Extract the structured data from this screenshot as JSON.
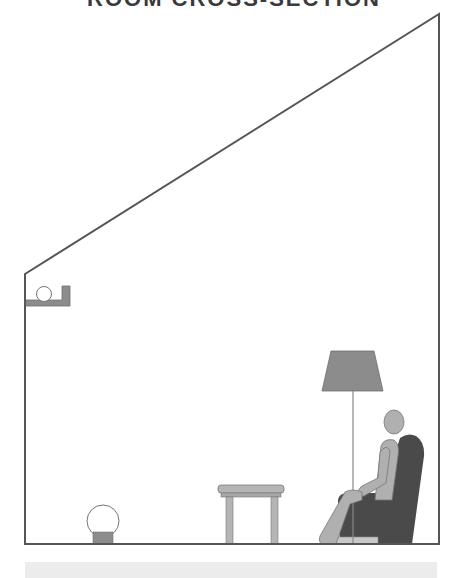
{
  "title": "ROOM CROSS-SECTION",
  "diagram": {
    "type": "room-cross-section",
    "room": {
      "outline_points": [
        [
          25,
          274
        ],
        [
          439,
          14
        ],
        [
          439,
          544
        ],
        [
          25,
          544
        ]
      ],
      "stroke_color": "#555555"
    },
    "elements": [
      {
        "name": "wall-shelf-lamp",
        "description": "globe lamp on wall-mounted bracket shelf"
      },
      {
        "name": "floor-globe-lamp",
        "description": "globe lamp on floor with base"
      },
      {
        "name": "side-table",
        "description": "small side table"
      },
      {
        "name": "floor-lamp",
        "description": "standing floor lamp with trapezoid shade"
      },
      {
        "name": "seated-person",
        "description": "person sitting in armchair"
      },
      {
        "name": "armchair",
        "description": "high-back armchair"
      },
      {
        "name": "footrest",
        "description": "low footrest"
      }
    ],
    "colors": {
      "outline": "#555555",
      "fixture_gray": "#8c8c8c",
      "light_gray": "#b5b5b5",
      "chair_dark": "#4a4a4a",
      "person": "#b0b0b0",
      "bulb_fill": "#ffffff",
      "caption_bar": "#ececec"
    }
  },
  "caption": ""
}
